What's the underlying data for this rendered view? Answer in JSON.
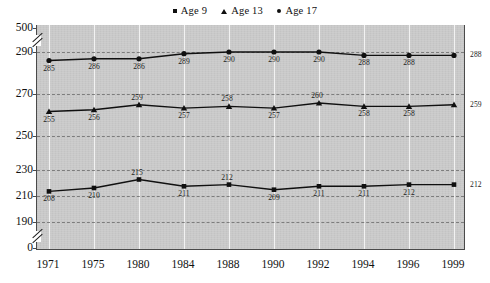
{
  "chart_data": {
    "type": "line",
    "title": "",
    "subtitle": "",
    "xlabel": "",
    "ylabel": "",
    "grid": true,
    "legend_position": "top-center",
    "categories": [
      "1971",
      "1975",
      "1980",
      "1984",
      "1988",
      "1990",
      "1992",
      "1994",
      "1996",
      "1999"
    ],
    "y_ticks": [
      "500",
      "290",
      "270",
      "250",
      "230",
      "210",
      "190",
      "0"
    ],
    "y_axis_breaks": [
      {
        "between": [
          "500",
          "290"
        ]
      },
      {
        "between": [
          "190",
          "0"
        ]
      }
    ],
    "ylim": [
      190,
      290
    ],
    "series": [
      {
        "name": "Age 9",
        "marker": "square",
        "color": "#101010",
        "values": [
          208,
          210,
          215,
          211,
          212,
          209,
          211,
          211,
          212,
          212
        ]
      },
      {
        "name": "Age 13",
        "marker": "triangle",
        "color": "#101010",
        "values": [
          255,
          256,
          259,
          257,
          258,
          257,
          260,
          258,
          258,
          259
        ]
      },
      {
        "name": "Age 17",
        "marker": "circle",
        "color": "#101010",
        "values": [
          285,
          286,
          286,
          289,
          290,
          290,
          290,
          288,
          288,
          288
        ]
      }
    ]
  },
  "legend": {
    "items": [
      {
        "label": "Age 9",
        "marker": "square"
      },
      {
        "label": "Age 13",
        "marker": "triangle"
      },
      {
        "label": "Age 17",
        "marker": "circle"
      }
    ]
  },
  "colors": {
    "plot_background": "#c9c9c9",
    "page_background": "#ffffff",
    "line": "#101010",
    "gridline_horizontal": "#7d7d7d",
    "gridline_vertical": "#f2f2f2",
    "axis": "#4a4a4a"
  }
}
